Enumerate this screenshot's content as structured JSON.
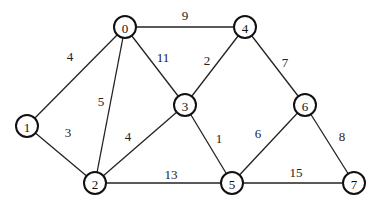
{
  "graph": {
    "nodes": [
      {
        "id": "0",
        "x": 125,
        "y": 27
      },
      {
        "id": "1",
        "x": 27,
        "y": 126
      },
      {
        "id": "2",
        "x": 95,
        "y": 183
      },
      {
        "id": "3",
        "x": 185,
        "y": 105
      },
      {
        "id": "4",
        "x": 245,
        "y": 27
      },
      {
        "id": "5",
        "x": 232,
        "y": 183
      },
      {
        "id": "6",
        "x": 305,
        "y": 105
      },
      {
        "id": "7",
        "x": 354,
        "y": 183
      }
    ],
    "edges": [
      {
        "from": "0",
        "to": "4",
        "weight": "9",
        "lx": 185,
        "ly": 15
      },
      {
        "from": "0",
        "to": "1",
        "weight": "4",
        "lx": 70,
        "ly": 56
      },
      {
        "from": "0",
        "to": "2",
        "weight": "5",
        "lx": 101,
        "ly": 101
      },
      {
        "from": "0",
        "to": "3",
        "weight": "11",
        "lx": 163,
        "ly": 57
      },
      {
        "from": "1",
        "to": "2",
        "weight": "3",
        "lx": 68,
        "ly": 132
      },
      {
        "from": "2",
        "to": "3",
        "weight": "4",
        "lx": 128,
        "ly": 136
      },
      {
        "from": "2",
        "to": "5",
        "weight": "13",
        "lx": 171,
        "ly": 174
      },
      {
        "from": "3",
        "to": "4",
        "weight": "2",
        "lx": 207,
        "ly": 60
      },
      {
        "from": "3",
        "to": "5",
        "weight": "1",
        "lx": 219,
        "ly": 138
      },
      {
        "from": "4",
        "to": "6",
        "weight": "7",
        "lx": 285,
        "ly": 62
      },
      {
        "from": "5",
        "to": "6",
        "weight": "6",
        "lx": 258,
        "ly": 133
      },
      {
        "from": "5",
        "to": "7",
        "weight": "15",
        "lx": 296,
        "ly": 172
      },
      {
        "from": "6",
        "to": "7",
        "weight": "8",
        "lx": 342,
        "ly": 136
      }
    ]
  }
}
